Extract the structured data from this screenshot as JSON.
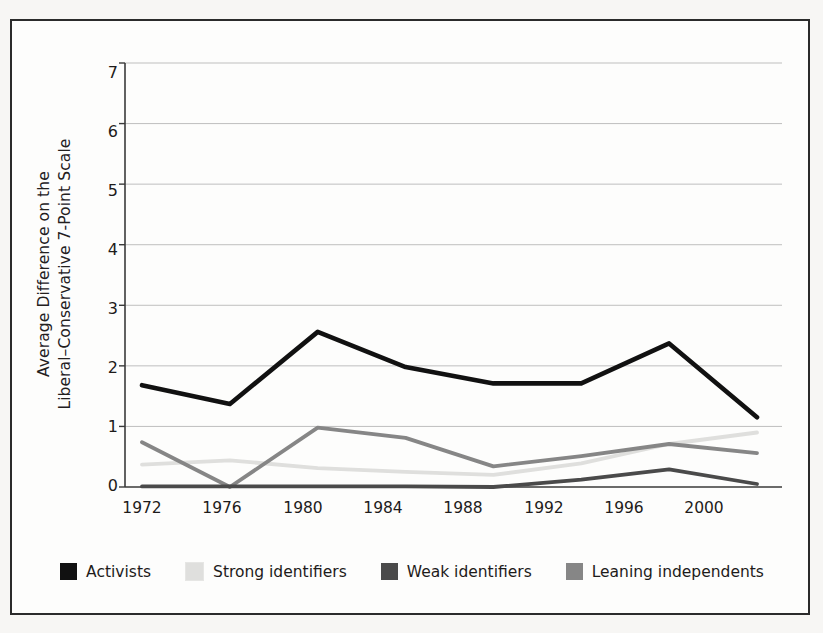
{
  "chart_data": {
    "type": "line",
    "title": "",
    "xlabel": "",
    "ylabel": "Average Difference on the\nLiberal–Conservative 7-Point Scale",
    "categories": [
      "1972",
      "1976",
      "1980",
      "1984",
      "1988",
      "1992",
      "1996",
      "2000"
    ],
    "x": [
      1972,
      1976,
      1980,
      1984,
      1988,
      1992,
      1996,
      2000
    ],
    "ylim": [
      0,
      7
    ],
    "yticks": [
      "0",
      "1",
      "2",
      "3",
      "4",
      "5",
      "6",
      "7"
    ],
    "grid": true,
    "legend_position": "bottom",
    "series": [
      {
        "name": "Activists",
        "color": "#111111",
        "values": [
          1.68,
          1.37,
          2.56,
          1.98,
          1.71,
          1.71,
          2.37,
          1.15
        ]
      },
      {
        "name": "Strong identifiers",
        "color": "#dfdfdd",
        "values": [
          0.37,
          0.44,
          0.31,
          0.25,
          0.2,
          0.39,
          0.71,
          0.9
        ]
      },
      {
        "name": "Weak identifiers",
        "color": "#4a4a4a",
        "values": [
          0.01,
          0.01,
          0.01,
          0.01,
          0.0,
          0.12,
          0.29,
          0.05
        ]
      },
      {
        "name": "Leaning independents",
        "color": "#868686",
        "values": [
          0.74,
          0.0,
          0.98,
          0.81,
          0.34,
          0.51,
          0.71,
          0.56
        ]
      }
    ]
  },
  "legend": {
    "items": [
      {
        "label": "Activists",
        "color": "#111111"
      },
      {
        "label": "Strong identifiers",
        "color": "#dfdfdd"
      },
      {
        "label": "Weak identifiers",
        "color": "#4a4a4a"
      },
      {
        "label": "Leaning independents",
        "color": "#868686"
      }
    ]
  },
  "axes": {
    "y_title": "Average Difference on the\nLiberal–Conservative 7-Point Scale",
    "y_ticks": [
      "7",
      "6",
      "5",
      "4",
      "3",
      "2",
      "1",
      "0"
    ],
    "x_ticks": [
      "1972",
      "1976",
      "1980",
      "1984",
      "1988",
      "1992",
      "1996",
      "2000"
    ]
  }
}
